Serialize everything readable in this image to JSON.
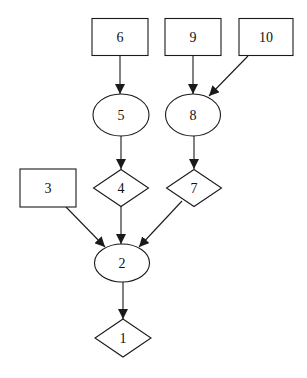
{
  "diagram": {
    "type": "directed-graph",
    "nodes": [
      {
        "id": "1",
        "label": "1",
        "shape": "diamond",
        "cx": 123,
        "cy": 338,
        "w": 56,
        "h": 38
      },
      {
        "id": "2",
        "label": "2",
        "shape": "ellipse",
        "cx": 122,
        "cy": 263,
        "w": 55,
        "h": 38
      },
      {
        "id": "3",
        "label": "3",
        "shape": "box",
        "cx": 48,
        "cy": 188,
        "w": 56,
        "h": 38
      },
      {
        "id": "4",
        "label": "4",
        "shape": "diamond",
        "cx": 121,
        "cy": 188,
        "w": 55,
        "h": 37
      },
      {
        "id": "5",
        "label": "5",
        "shape": "ellipse",
        "cx": 121,
        "cy": 115,
        "w": 56,
        "h": 42
      },
      {
        "id": "6",
        "label": "6",
        "shape": "box",
        "cx": 120,
        "cy": 37,
        "w": 56,
        "h": 37
      },
      {
        "id": "7",
        "label": "7",
        "shape": "diamond",
        "cx": 194,
        "cy": 188,
        "w": 55,
        "h": 37
      },
      {
        "id": "8",
        "label": "8",
        "shape": "ellipse",
        "cx": 193,
        "cy": 115,
        "w": 55,
        "h": 42
      },
      {
        "id": "9",
        "label": "9",
        "shape": "box",
        "cx": 193,
        "cy": 37,
        "w": 56,
        "h": 37
      },
      {
        "id": "10",
        "label": "10",
        "shape": "box",
        "cx": 266,
        "cy": 37,
        "w": 54,
        "h": 37
      }
    ],
    "edges": [
      {
        "from": "6",
        "to": "5",
        "x1": 120,
        "y1": 56,
        "x2": 120,
        "y2": 94
      },
      {
        "from": "9",
        "to": "8",
        "x1": 193,
        "y1": 56,
        "x2": 193,
        "y2": 94
      },
      {
        "from": "10",
        "to": "8",
        "x1": 248,
        "y1": 56,
        "x2": 209,
        "y2": 96
      },
      {
        "from": "5",
        "to": "4",
        "x1": 121,
        "y1": 136,
        "x2": 121,
        "y2": 169
      },
      {
        "from": "8",
        "to": "7",
        "x1": 194,
        "y1": 136,
        "x2": 194,
        "y2": 169
      },
      {
        "from": "3",
        "to": "2",
        "x1": 66,
        "y1": 207,
        "x2": 105,
        "y2": 247
      },
      {
        "from": "4",
        "to": "2",
        "x1": 121,
        "y1": 206,
        "x2": 121,
        "y2": 244
      },
      {
        "from": "7",
        "to": "2",
        "x1": 182,
        "y1": 201,
        "x2": 139,
        "y2": 247
      },
      {
        "from": "2",
        "to": "1",
        "x1": 123,
        "y1": 282,
        "x2": 123,
        "y2": 319
      }
    ]
  }
}
